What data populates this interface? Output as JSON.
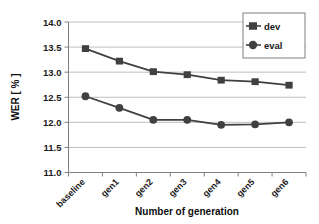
{
  "chart_data": {
    "type": "line",
    "title": "",
    "xlabel": "Number of generation",
    "ylabel": "WER [ % ]",
    "categories": [
      "baseline",
      "gen1",
      "gen2",
      "gen3",
      "gen4",
      "gen5",
      "gen6"
    ],
    "series": [
      {
        "name": "dev",
        "marker": "square",
        "color": "#404040",
        "values": [
          13.47,
          13.22,
          13.01,
          12.95,
          12.84,
          12.81,
          12.74
        ]
      },
      {
        "name": "eval",
        "marker": "circle",
        "color": "#404040",
        "values": [
          12.52,
          12.29,
          12.05,
          12.05,
          11.95,
          11.96,
          12.0
        ]
      }
    ],
    "ylim": [
      11.0,
      14.0
    ],
    "ytick_values": [
      "11.0",
      "11.5",
      "12.0",
      "12.5",
      "13.0",
      "13.5",
      "14.0"
    ],
    "ytick_numbers": [
      11.0,
      11.5,
      12.0,
      12.5,
      13.0,
      13.5,
      14.0
    ],
    "grid": true,
    "grid_color": "#bfbfbf",
    "axis_color": "#808080",
    "legend_position": "top-right",
    "legend_entries": [
      "dev",
      "eval"
    ]
  }
}
